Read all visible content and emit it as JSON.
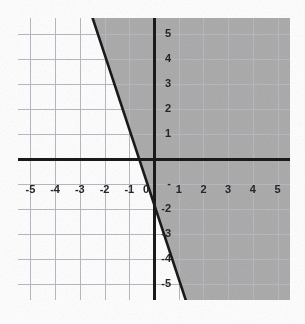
{
  "figure": {
    "background_color": "#ffffff",
    "plot_background_color": "#ffffff"
  },
  "chart_data": {
    "type": "line",
    "title": "",
    "subtitle": "",
    "xlabel": "",
    "ylabel": "",
    "xlim": [
      -5.5,
      5.5
    ],
    "ylim": [
      -5.65,
      5.65
    ],
    "grid": true,
    "grid_color": "#b9b9c4",
    "grid_spacing": 1,
    "axis_color": "#1a1a1a",
    "legend": null,
    "legend_position": "none",
    "annotations": [],
    "xticks": [
      -5,
      -4,
      -3,
      -2,
      -1,
      0,
      1,
      2,
      3,
      4,
      5
    ],
    "xtick_labels": [
      "-5",
      "-4",
      "-3",
      "-2",
      "-1",
      "0",
      "1",
      "2",
      "3",
      "4",
      "5"
    ],
    "yticks": [
      5,
      4,
      3,
      2,
      1,
      -1,
      -2,
      -3,
      -4,
      -5
    ],
    "ytick_labels": [
      "5",
      "4",
      "3",
      "2",
      "1",
      "-",
      "-2",
      "-3",
      "-4",
      "-5"
    ],
    "series": [
      {
        "name": "boundary-line",
        "kind": "line",
        "style": "solid",
        "color": "#1a1a1a",
        "width": 2.6,
        "slope": -3,
        "intercept": -1.8,
        "equation": "y = -3x - 1.8",
        "x_intercept": -0.6,
        "y_intercept": -1.8,
        "points": [
          [
            -2.48,
            5.65
          ],
          [
            -0.6,
            0
          ],
          [
            0,
            -1.8
          ],
          [
            1.12,
            -5.15
          ]
        ]
      },
      {
        "name": "shaded-region",
        "kind": "region",
        "color": "#a9a9a9",
        "side": "above-right",
        "inequality": "y >= -3x - 1.8",
        "boundary_included": true
      }
    ]
  },
  "axes": {
    "x_axis_label": "",
    "y_axis_label": "",
    "origin_label": "0"
  }
}
